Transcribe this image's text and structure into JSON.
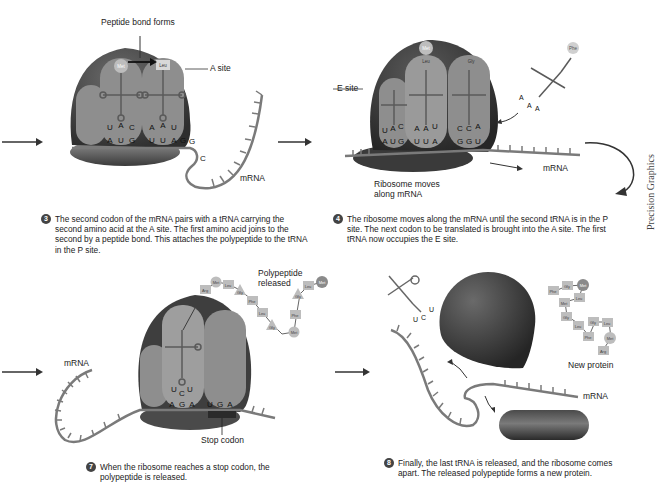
{
  "figure": {
    "colors": {
      "ribosome_dark": "#3e3e3e",
      "ribosome_light": "#6c6c6c",
      "site_fill": "#8e8e8e",
      "mrna": "#7a7a7a",
      "amino_acid": "#bdbdbd",
      "text": "#222222"
    },
    "credit": "Precision Graphics"
  },
  "panels": [
    {
      "step": "3",
      "labels": {
        "peptide_bond": "Peptide bond forms",
        "a_site": "A site",
        "mrna": "mRNA"
      },
      "amino_acids": [
        "Met",
        "Leu"
      ],
      "anticodons": [
        "U",
        "A",
        "C",
        "A",
        "A",
        "U"
      ],
      "codons": [
        "A",
        "U",
        "G",
        "U",
        "U",
        "A",
        "G",
        "G",
        "C"
      ],
      "caption": "The second codon of the mRNA pairs with a tRNA carrying the second amino acid at the A site. The first amino acid joins to the second by a peptide bond. This attaches the polypeptide to the tRNA in the P site."
    },
    {
      "step": "4",
      "labels": {
        "e_site": "E site",
        "mrna": "mRNA",
        "ribosome_moves": "Ribosome moves along mRNA"
      },
      "amino_acids": [
        "Met",
        "Leu",
        "Gly",
        "Phe"
      ],
      "anticodons": [
        "U",
        "A",
        "C",
        "A",
        "A",
        "U",
        "C",
        "C",
        "A"
      ],
      "incoming_anticodon": [
        "A",
        "A",
        "A"
      ],
      "codons": [
        "A",
        "U",
        "G",
        "U",
        "U",
        "A",
        "G",
        "G",
        "U"
      ],
      "caption": "The ribosome moves along the mRNA until the second tRNA is in the P site. The next codon to be translated is brought into the A site. The first tRNA now occupies the E site."
    },
    {
      "step": "7",
      "labels": {
        "mrna": "mRNA",
        "polypeptide_released": "Polypeptide released",
        "stop_codon": "Stop codon"
      },
      "polypeptide": [
        "Arg",
        "Met",
        "Leu",
        "Gly",
        "Phe",
        "Leu",
        "Gly",
        "Met",
        "Phe",
        "Gly",
        "Leu",
        "Met"
      ],
      "anticodons": [
        "U",
        "C",
        "U"
      ],
      "codons": [
        "A",
        "G",
        "A",
        "U",
        "G",
        "A"
      ],
      "caption": "When the ribosome reaches a stop codon, the polypeptide is released."
    },
    {
      "step": "8",
      "labels": {
        "new_protein": "New protein",
        "mrna": "mRNA"
      },
      "new_protein": [
        "Phe",
        "Gly",
        "Met",
        "Met",
        "Leu",
        "Gly",
        "Gly",
        "Leu",
        "Leu",
        "Phe",
        "Met",
        "Arg"
      ],
      "released_anticodon": [
        "U",
        "C",
        "U"
      ],
      "caption": "Finally, the last tRNA is released, and the ribosome comes apart. The released polypeptide forms a new protein."
    }
  ]
}
